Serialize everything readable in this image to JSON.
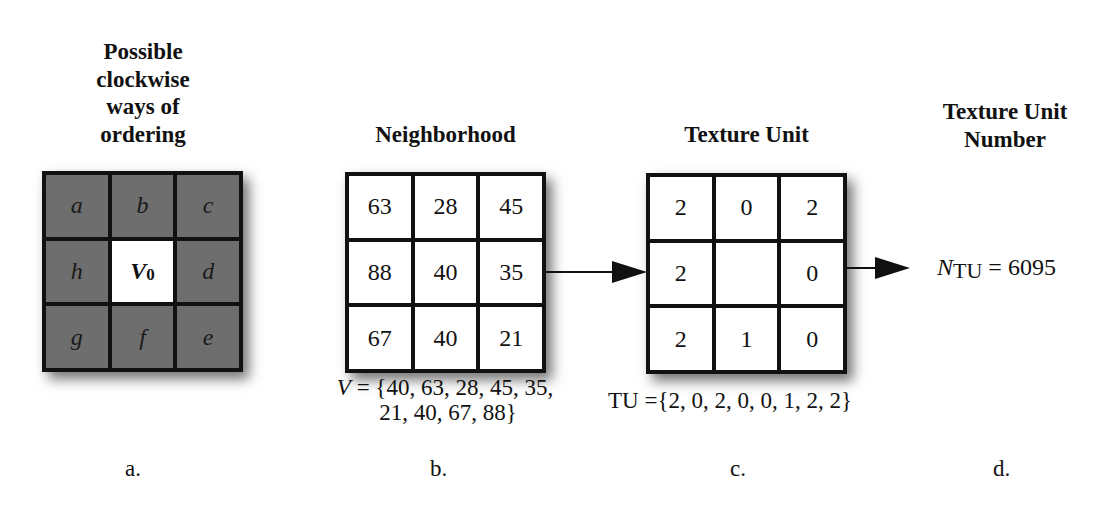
{
  "panels": {
    "a": {
      "title_lines": [
        "Possible",
        "clockwise",
        "ways of",
        "ordering"
      ],
      "cells": [
        "a",
        "b",
        "c",
        "h",
        "V",
        "d",
        "g",
        "f",
        "e"
      ],
      "center_subscript": "0",
      "caption": "a."
    },
    "b": {
      "title": "Neighborhood",
      "cells": [
        "63",
        "28",
        "45",
        "88",
        "40",
        "35",
        "67",
        "40",
        "21"
      ],
      "formula_var": "V",
      "formula_line1": " = {40, 63, 28, 45, 35,",
      "formula_line2": "21, 40, 67, 88}",
      "caption": "b."
    },
    "c": {
      "title": "Texture Unit",
      "cells": [
        "2",
        "0",
        "2",
        "2",
        "",
        "0",
        "2",
        "1",
        "0"
      ],
      "formula": "TU ={2, 0, 2, 0, 0, 1, 2, 2}",
      "caption": "c."
    },
    "d": {
      "title_lines": [
        "Texture Unit",
        "Number"
      ],
      "ntu_symbol": "N",
      "ntu_subscript": "TU",
      "ntu_value": " = 6095",
      "caption": "d."
    }
  },
  "icons": {
    "arrow_1": "right-arrow",
    "arrow_2": "right-arrow"
  },
  "colors": {
    "ordering_cell_fill": "#6e6e6e",
    "grid_border": "#111111",
    "cell_fill": "#ffffff"
  }
}
